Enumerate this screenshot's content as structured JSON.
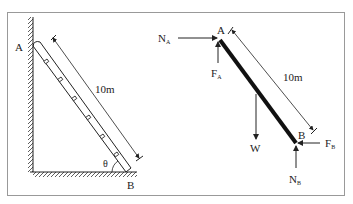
{
  "left_figure": {
    "point_top": "A",
    "point_bottom": "B",
    "length_label": "10m",
    "angle_label": "θ"
  },
  "right_figure": {
    "point_top": "A",
    "point_bottom": "B",
    "length_label": "10m",
    "forces": {
      "normal_a": {
        "main": "N",
        "sub": "A"
      },
      "friction_a": {
        "main": "F",
        "sub": "A"
      },
      "weight": {
        "main": "W",
        "sub": ""
      },
      "friction_b": {
        "main": "F",
        "sub": "B"
      },
      "normal_b": {
        "main": "N",
        "sub": "B"
      }
    }
  },
  "colors": {
    "line": "#222222",
    "frame": "#999999",
    "background": "#ffffff"
  }
}
